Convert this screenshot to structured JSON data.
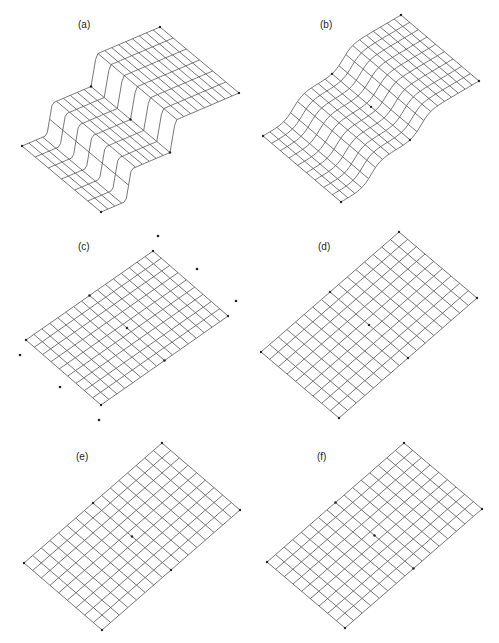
{
  "figure": {
    "panels": [
      {
        "id": "a",
        "label": "(a)",
        "label_pos": [
          86,
          26
        ],
        "corners": {
          "left": [
            22,
            146
          ],
          "bottom": [
            101,
            212
          ],
          "top": [
            160,
            27
          ],
          "right": [
            238,
            93
          ]
        },
        "rows": 6,
        "cols": 20,
        "surface": "step",
        "amp": 30
      },
      {
        "id": "b",
        "label": "(b)",
        "label_pos": [
          328,
          26
        ],
        "corners": {
          "left": [
            263,
            136
          ],
          "bottom": [
            341,
            202
          ],
          "top": [
            401,
            15
          ],
          "right": [
            479,
            81
          ]
        },
        "rows": 9,
        "cols": 20,
        "surface": "sigmoid",
        "amp": 20
      },
      {
        "id": "c",
        "label": "(c)",
        "label_pos": [
          86,
          248
        ],
        "corners": {
          "left": [
            26,
            340
          ],
          "bottom": [
            101,
            405
          ],
          "top": [
            153,
            251
          ],
          "right": [
            231,
            315
          ]
        },
        "rows": 9,
        "cols": 16,
        "surface": "flat",
        "amp": 0,
        "outliers": [
          [
            158,
            236
          ],
          [
            197,
            269
          ],
          [
            236,
            301
          ],
          [
            20,
            355
          ],
          [
            60,
            387
          ],
          [
            99,
            420
          ]
        ]
      },
      {
        "id": "d",
        "label": "(d)",
        "label_pos": [
          326,
          248
        ],
        "corners": {
          "left": [
            261,
            352
          ],
          "bottom": [
            339,
            418
          ],
          "top": [
            399,
            232
          ],
          "right": [
            478,
            298
          ]
        },
        "rows": 9,
        "cols": 16,
        "surface": "flat",
        "amp": 0
      },
      {
        "id": "e",
        "label": "(e)",
        "label_pos": [
          84,
          458
        ],
        "corners": {
          "left": [
            24,
            563
          ],
          "bottom": [
            102,
            630
          ],
          "top": [
            162,
            443
          ],
          "right": [
            239,
            510
          ]
        },
        "rows": 9,
        "cols": 16,
        "surface": "flat",
        "amp": 0
      },
      {
        "id": "f",
        "label": "(f)",
        "label_pos": [
          325,
          458
        ],
        "corners": {
          "left": [
            267,
            562
          ],
          "bottom": [
            345,
            628
          ],
          "top": [
            404,
            443
          ],
          "right": [
            482,
            510
          ]
        },
        "rows": 9,
        "cols": 16,
        "surface": "flat",
        "amp": 0
      }
    ],
    "line_color": "#555555",
    "dot_color": "#222222"
  }
}
